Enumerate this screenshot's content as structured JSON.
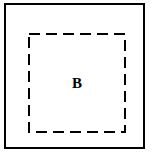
{
  "figure": {
    "type": "geometric-diagram",
    "background_color": "#ffffff",
    "stroke_color": "#000000",
    "outer_rectangle": {
      "name": "outer-boundary",
      "style": "solid",
      "stroke_width": "2",
      "fill": "none",
      "x": 4,
      "y": 3,
      "width": 141,
      "height": 146
    },
    "inner_rectangle": {
      "name": "dashed-region",
      "label": "B",
      "style": "dashed",
      "stroke_width": "2",
      "dash_length": 11,
      "gap_length": 6,
      "fill": "none",
      "x": 22,
      "y": 28,
      "width": 98,
      "height": 100
    },
    "labels": [
      {
        "text": "B",
        "role": "region-label",
        "color": "#000000",
        "weight": "bold",
        "font_size": 15
      }
    ]
  }
}
